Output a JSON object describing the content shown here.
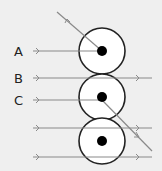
{
  "diagram": {
    "type": "ray-deflection-diagram",
    "labels": [
      "A",
      "B",
      "C"
    ],
    "rays": [
      {
        "label": "A",
        "description": "ray hits center of first circle and deflects back up-left"
      },
      {
        "label": "B",
        "description": "ray passes between first and second circles undeflected"
      },
      {
        "label": "C",
        "description": "ray hits center of second circle and deflects down-right"
      },
      {
        "label": "",
        "description": "ray passes through third circle undeflected"
      },
      {
        "label": "",
        "description": "ray passes below third circle undeflected"
      }
    ],
    "circles": 3,
    "colors": {
      "background": "#efefef",
      "ray": "#8a8a8a",
      "circle_stroke": "#222222",
      "circle_fill": "#ffffff",
      "nucleus": "#000000"
    }
  }
}
